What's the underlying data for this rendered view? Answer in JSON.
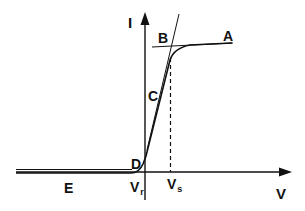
{
  "diagram": {
    "type": "I-V characteristic curve",
    "axes": {
      "x_label": "V",
      "y_label": "I"
    },
    "point_labels": {
      "A": "A",
      "B": "B",
      "C": "C",
      "D": "D",
      "E": "E"
    },
    "tick_labels": {
      "vr_main": "V",
      "vr_sub": "r",
      "vs_main": "V",
      "vs_sub": "s"
    },
    "colors": {
      "line": "#111111",
      "background": "#ffffff"
    }
  }
}
